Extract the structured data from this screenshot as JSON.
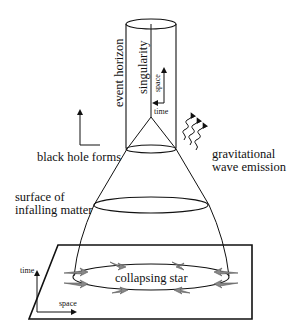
{
  "diagram": {
    "labels": {
      "event_horizon": "event horizon",
      "singularity": "singularity",
      "space_upper": "space",
      "time_upper": "time",
      "black_hole_forms": "black hole forms",
      "gravitational_1": "gravitational",
      "gravitational_2": "wave emission",
      "surface_1": "surface of",
      "surface_2": "infalling matter",
      "collapsing_star": "collapsing star",
      "time_lower": "time",
      "space_lower": "space"
    },
    "colors": {
      "line": "#111111",
      "star_marks": "#777777",
      "background": "#ffffff"
    }
  }
}
